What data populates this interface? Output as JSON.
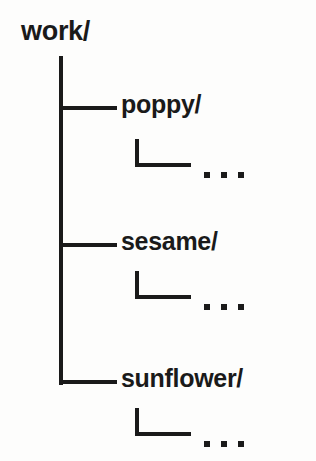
{
  "diagram": {
    "type": "directory-tree",
    "line_color": "#1a1a1a",
    "background_color": "#fdfdfc",
    "root": {
      "label": "work/"
    },
    "children": [
      {
        "label": "poppy/",
        "ellipsis": "...",
        "dots": [
          "·",
          "·",
          "·"
        ]
      },
      {
        "label": "sesame/",
        "ellipsis": "...",
        "dots": [
          "·",
          "·",
          "·"
        ]
      },
      {
        "label": "sunflower/",
        "ellipsis": "...",
        "dots": [
          "·",
          "·",
          "·"
        ]
      }
    ]
  }
}
